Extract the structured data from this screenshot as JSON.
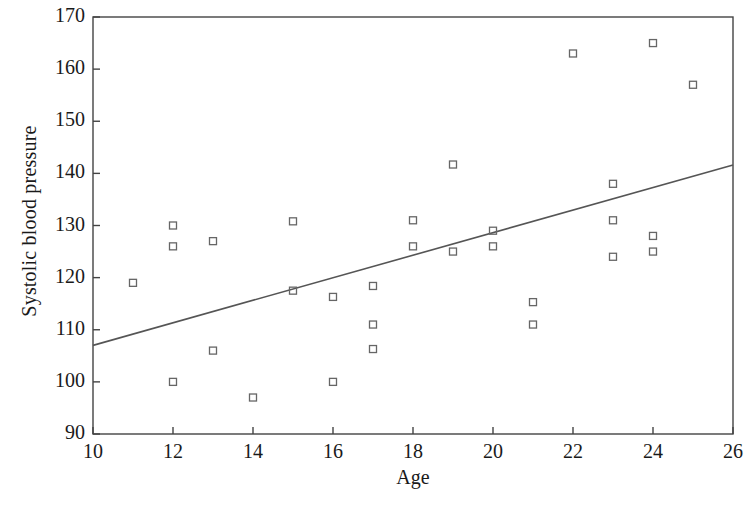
{
  "chart_data": {
    "type": "scatter",
    "title": "",
    "xlabel": "Age",
    "ylabel": "Systolic blood pressure",
    "xlim": [
      10,
      26
    ],
    "ylim": [
      90,
      170
    ],
    "xticks": [
      10,
      12,
      14,
      16,
      18,
      20,
      22,
      24,
      26
    ],
    "yticks": [
      90,
      100,
      110,
      120,
      130,
      140,
      150,
      160,
      170
    ],
    "grid": false,
    "legend": null,
    "marker": "open-square",
    "marker_color": "#666666",
    "line_color": "#555555",
    "frame": true,
    "points": [
      {
        "x": 11,
        "y": 119
      },
      {
        "x": 12,
        "y": 130
      },
      {
        "x": 12,
        "y": 126
      },
      {
        "x": 12,
        "y": 100
      },
      {
        "x": 13,
        "y": 127
      },
      {
        "x": 13,
        "y": 106
      },
      {
        "x": 14,
        "y": 97
      },
      {
        "x": 15,
        "y": 130.8
      },
      {
        "x": 15,
        "y": 117.5
      },
      {
        "x": 16,
        "y": 116.3
      },
      {
        "x": 16,
        "y": 100
      },
      {
        "x": 17,
        "y": 118.4
      },
      {
        "x": 17,
        "y": 111
      },
      {
        "x": 17,
        "y": 106.3
      },
      {
        "x": 18,
        "y": 131
      },
      {
        "x": 18,
        "y": 126
      },
      {
        "x": 19,
        "y": 141.7
      },
      {
        "x": 19,
        "y": 125
      },
      {
        "x": 20,
        "y": 129
      },
      {
        "x": 20,
        "y": 126
      },
      {
        "x": 21,
        "y": 115.3
      },
      {
        "x": 21,
        "y": 111
      },
      {
        "x": 22,
        "y": 163
      },
      {
        "x": 23,
        "y": 138
      },
      {
        "x": 23,
        "y": 131
      },
      {
        "x": 23,
        "y": 124
      },
      {
        "x": 24,
        "y": 165
      },
      {
        "x": 24,
        "y": 128
      },
      {
        "x": 24,
        "y": 125
      },
      {
        "x": 25,
        "y": 157
      }
    ],
    "trendline": {
      "x0": 10,
      "y0": 107,
      "x1": 26,
      "y1": 141.6
    }
  }
}
